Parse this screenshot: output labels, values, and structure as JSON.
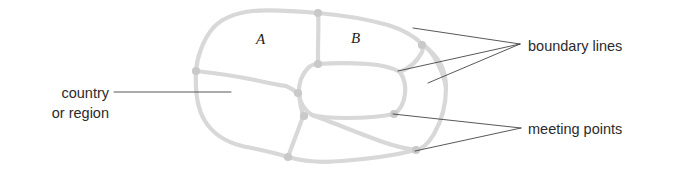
{
  "figure": {
    "kind": "map-diagram",
    "background_color": "#ffffff",
    "line_color": "#d8d8d8",
    "node_color": "#c9c9c9",
    "leader_color": "#3a3a3a",
    "text_color": "#2b2b2b"
  },
  "region_labels": [
    {
      "id": "a",
      "text": "A"
    },
    {
      "id": "b",
      "text": "B"
    }
  ],
  "callouts": [
    {
      "id": "country",
      "line1": "country",
      "line2": "or region",
      "full_text": "country or region",
      "side": "left"
    },
    {
      "id": "boundary",
      "text": "boundary lines",
      "side": "right",
      "leader_count": 3
    },
    {
      "id": "meeting",
      "text": "meeting points",
      "side": "right",
      "leader_count": 2
    }
  ]
}
